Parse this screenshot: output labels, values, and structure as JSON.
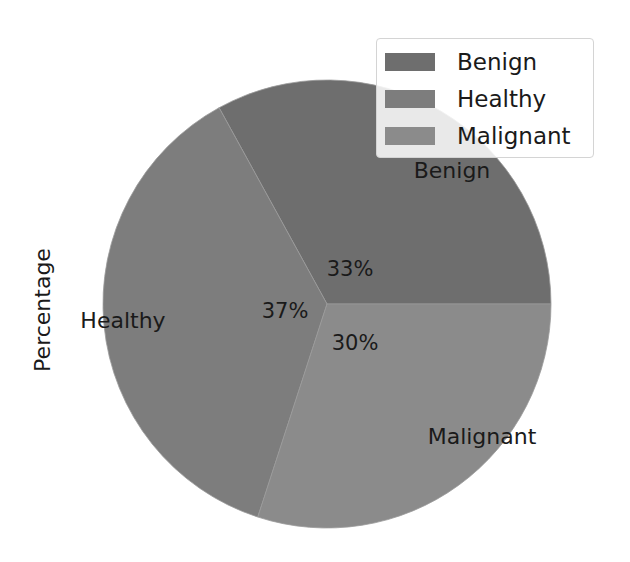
{
  "chart_data": {
    "type": "pie",
    "title": "",
    "ylabel": "Percentage",
    "categories": [
      "Benign",
      "Healthy",
      "Malignant"
    ],
    "values": [
      33,
      37,
      30
    ],
    "autopct_labels": [
      "33%",
      "37%",
      "30%"
    ],
    "colors": [
      "#6e6e6e",
      "#7d7d7d",
      "#8b8b8b"
    ],
    "start_angle": 0,
    "legend_position": "upper right",
    "legend": [
      "Benign",
      "Healthy",
      "Malignant"
    ]
  },
  "labels": {
    "ylabel": "Percentage",
    "slices": [
      {
        "name": "Benign",
        "pct": "33%"
      },
      {
        "name": "Healthy",
        "pct": "37%"
      },
      {
        "name": "Malignant",
        "pct": "30%"
      }
    ]
  },
  "legend": {
    "items": [
      {
        "label": "Benign",
        "color": "#6e6e6e"
      },
      {
        "label": "Healthy",
        "color": "#7d7d7d"
      },
      {
        "label": "Malignant",
        "color": "#8b8b8b"
      }
    ]
  }
}
